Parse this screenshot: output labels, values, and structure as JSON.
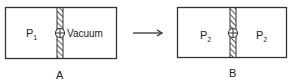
{
  "panel_a": {
    "caption": "A",
    "left_label": "P",
    "left_label_sub": "1",
    "right_label": "Vacuum"
  },
  "panel_b": {
    "caption": "B",
    "left_label": "P",
    "left_label_sub": "2",
    "right_label": "P",
    "right_label_sub": "2"
  },
  "arrow": "right-arrow",
  "colors": {
    "stroke": "#333333",
    "background": "#ffffff"
  }
}
